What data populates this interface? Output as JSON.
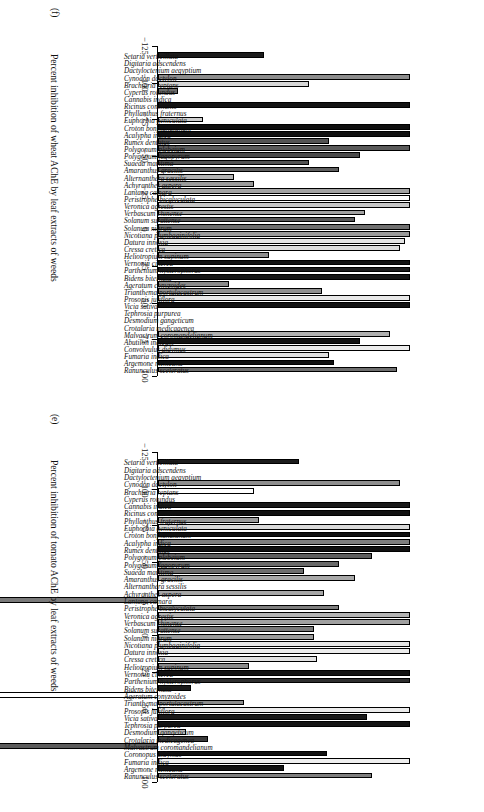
{
  "figure": {
    "orientation_note": "rotated-90",
    "axis": {
      "ticks": [
        -125,
        -100,
        -75,
        -50,
        -25,
        0,
        25,
        50,
        75,
        100
      ],
      "tick_labels": [
        "−125",
        "−100",
        "−75",
        "−50",
        "−25",
        "0",
        "25",
        "50",
        "75",
        "100"
      ],
      "min": -125,
      "max": 100
    }
  },
  "chart_data": [
    {
      "type": "bar",
      "panel": "(e)",
      "orientation": "vertical-bars-rotated",
      "title": "",
      "xlabel": "",
      "ylabel": "Percent inhibition of tomato AChE by leaf extracts of weeds",
      "ylim": [
        -125,
        100
      ],
      "grid": false,
      "legend": "none",
      "categories": [
        "Setaria verticillata",
        "Digitaria adscendens",
        "Dactyloctenium aegyptium",
        "Cynodon dactylon",
        "Brachiaria reptans",
        "Cyperus rotundus",
        "Cannabis indica",
        "Ricinus communis",
        "Phyllanthus fraternus",
        "Euphorbia geniculata",
        "Croton bonplandianum",
        "Acalypha indica",
        "Rumex dentatus",
        "Polygonum plebeium",
        "Polygonum fagopyrum",
        "Suaeda maritima",
        "Amaranthus gracilis",
        "Alternanthera sessilis",
        "Achyranthes aspera",
        "Lantana camara",
        "Peristrophe bicalyculata",
        "Veronica agrestis",
        "Verbascum chinense",
        "Solanum surattense",
        "Solanum nigrum",
        "Nicotiana plumbaginifolia",
        "Datura innoxia",
        "Cressa cretica",
        "Heliotropium supinum",
        "Vernonia cinerea",
        "Parthenium hysterophorus",
        "Bidens biternata",
        "Ageratum conyzoides",
        "Trianthema portulacastrum",
        "Prosopis juliflora",
        "Vicia sativa",
        "Tephrosia purpurea",
        "Desmodium gangeticum",
        "Crotalaria medicagenea",
        "Malvastrum coromandelianum",
        "Coronopus didymus",
        "Fumaria indica",
        "Argemone mexicana",
        "Ranunculus sceleratus"
      ],
      "values": [
        56,
        0,
        0,
        96,
        38,
        0,
        100,
        100,
        40,
        100,
        100,
        100,
        100,
        85,
        72,
        58,
        78,
        0,
        66,
        -105,
        72,
        100,
        100,
        62,
        62,
        100,
        100,
        63,
        36,
        100,
        100,
        13,
        -105,
        34,
        100,
        83,
        100,
        11,
        20,
        -70,
        67,
        100,
        50,
        85
      ],
      "bar_fills": [
        "#1c1c1c",
        "#ffffff",
        "#ffffff",
        "#8e8e8e",
        "#ffffff",
        "#5a5a5a",
        "#1a1a1a",
        "#111111",
        "#9a9a9a",
        "#d9d9d9",
        "#111111",
        "#7e7e7e",
        "#111111",
        "#5e5e5e",
        "#6a6a6a",
        "#6e6e6e",
        "#a8a8a8",
        "#ffffff",
        "#a6a6a6",
        "#7a7a7a",
        "#7e7e7e",
        "#b4b4b4",
        "#a0a0a0",
        "#787878",
        "#9b9b9b",
        "#e6e6e6",
        "#ececec",
        "#e2e2e2",
        "#8a8a8a",
        "#121212",
        "#2e2e2e",
        "#1a1a1a",
        "#ffffff",
        "#8c8c8c",
        "#ececec",
        "#1a1a1a",
        "#141414",
        "#b8b8b8",
        "#3a3a3a",
        "#5c5c5c",
        "#111111",
        "#efefef",
        "#121212",
        "#7e7e7e"
      ]
    },
    {
      "type": "bar",
      "panel": "(f)",
      "orientation": "vertical-bars-rotated",
      "title": "",
      "xlabel": "",
      "ylabel": "Percent inhibition of wheat AChE by leaf extracts of weeds",
      "ylim": [
        -125,
        100
      ],
      "grid": false,
      "legend": "none",
      "categories": [
        "Setaria verticillata",
        "Digitaria adscendens",
        "Dactyloctenium aegyptium",
        "Cynodon dactylon",
        "Brachiaria reptans",
        "Cyperus rotundus",
        "Cannabis indica",
        "Ricinus communis",
        "Phyllanthus fraternus",
        "Euphorbia geniculata",
        "Croton bonplandianum",
        "Acalypha indica",
        "Rumex dentatus",
        "Polygonum plebeium",
        "Polygonum fagopyrum",
        "Suaeda maritima",
        "Amaranthus gracilis",
        "Alternanthera sessilis",
        "Achyranthes aspera",
        "Lantana camara",
        "Peristrophe bicalyculata",
        "Veronica agrestis",
        "Verbascum chinense",
        "Solanum surattense",
        "Solanum nigrum",
        "Nicotiana plumbaginifolia",
        "Datura innoxia",
        "Cressa cretica",
        "Heliotropium supinum",
        "Vernonia cinerea",
        "Parthenium hysterophorus",
        "Bidens biternata",
        "Ageratum conyzoides",
        "Trianthema portulacastrum",
        "Prosopis juliflora",
        "Vicia sativa",
        "Tephrosia purpurea",
        "Desmodium gangeticum",
        "Crotalaria medicagenea",
        "Malvastrum coromandelianum",
        "Abutilon indicum",
        "Convolvulus didymus",
        "Fumaria indica",
        "Argemone mexicana",
        "Ranunculus sceleratus"
      ],
      "values": [
        42,
        0,
        0,
        100,
        60,
        8,
        0,
        100,
        0,
        18,
        100,
        100,
        68,
        100,
        80,
        60,
        72,
        30,
        38,
        100,
        100,
        100,
        82,
        78,
        100,
        100,
        98,
        96,
        44,
        100,
        100,
        100,
        28,
        65,
        100,
        100,
        0,
        0,
        0,
        92,
        80,
        100,
        68,
        70,
        95
      ],
      "bar_fills": [
        "#1c1c1c",
        "#ffffff",
        "#ffffff",
        "#8c8c8c",
        "#d6d6d6",
        "#6a6a6a",
        "#ffffff",
        "#141414",
        "#ffffff",
        "#cfcfcf",
        "#0f0f0f",
        "#111111",
        "#545454",
        "#5a5a5a",
        "#4a4a4a",
        "#525252",
        "#5e5e5e",
        "#b4b4b4",
        "#9a9a9a",
        "#a4a4a4",
        "#ffffff",
        "#c6c6c6",
        "#a2a2a2",
        "#5a5a5a",
        "#707070",
        "#9a9a9a",
        "#e4e4e4",
        "#dcdcdc",
        "#8e8e8e",
        "#121212",
        "#1c1c1c",
        "#171717",
        "#8a8a8a",
        "#8e8e8e",
        "#e8e8e8",
        "#121212",
        "#ffffff",
        "#ffffff",
        "#ffffff",
        "#b0b0b0",
        "#121212",
        "#ececec",
        "#e0e0e0",
        "#111111",
        "#6e6e6e"
      ]
    }
  ],
  "panel_f": {
    "tag": "(f)",
    "axis_title": "Percent inhibition of wheat AChE by leaf extracts of weeds"
  },
  "panel_e": {
    "tag": "(e)",
    "axis_title": "Percent inhibition of tomato AChE by leaf extracts of weeds"
  }
}
